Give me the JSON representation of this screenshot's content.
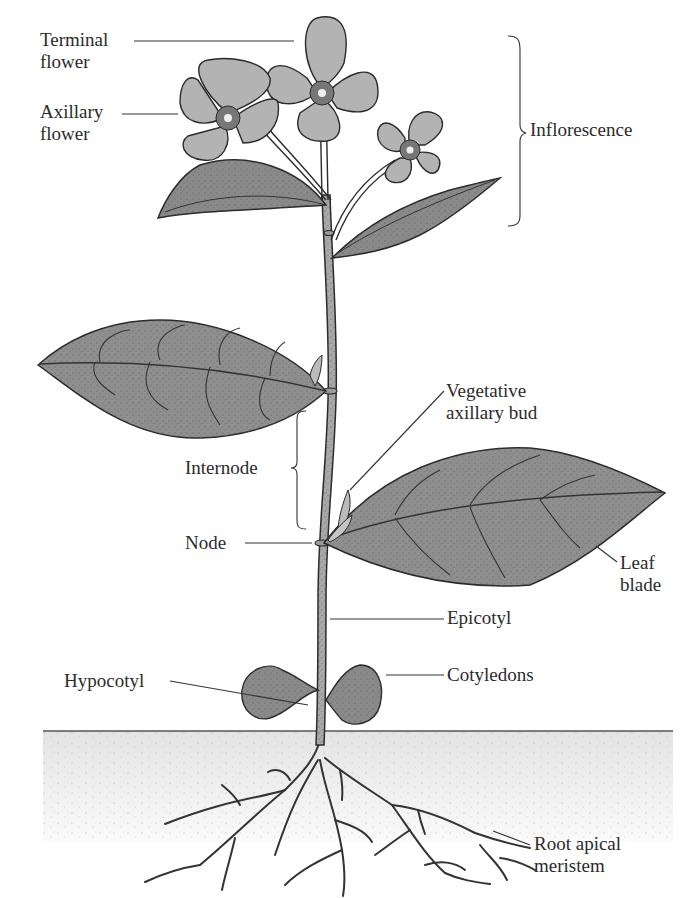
{
  "diagram": {
    "colors": {
      "background": "#ffffff",
      "petal": "#b3b3b3",
      "leaf": "#8f8f8f",
      "stem": "#a8a8a8",
      "outline": "#2a2a2a",
      "soil": "#ececec",
      "text": "#2b2b2b"
    },
    "labels": {
      "terminal_flower": [
        "Terminal",
        "flower"
      ],
      "axillary_flower": [
        "Axillary",
        "flower"
      ],
      "inflorescence": "Inflorescence",
      "vegetative_axillary_bud": [
        "Vegetative",
        "axillary bud"
      ],
      "internode": "Internode",
      "node": "Node",
      "leaf_blade": [
        "Leaf",
        "blade"
      ],
      "epicotyl": "Epicotyl",
      "cotyledons": "Cotyledons",
      "hypocotyl": "Hypocotyl",
      "root_apical_meristem": [
        "Root apical",
        "meristem"
      ]
    }
  }
}
